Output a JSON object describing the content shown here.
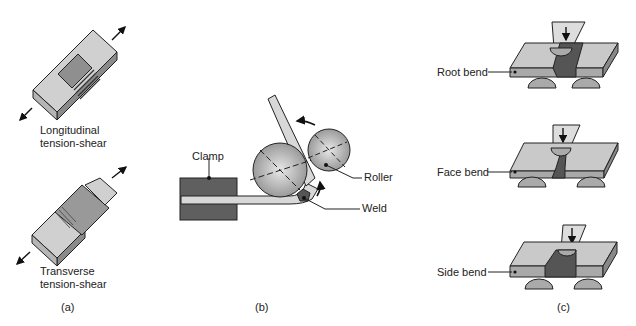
{
  "panels": {
    "a": {
      "caption": "(a)",
      "specimens": [
        {
          "label_line1": "Longitudinal",
          "label_line2": "tension-shear"
        },
        {
          "label_line1": "Transverse",
          "label_line2": "tension-shear"
        }
      ]
    },
    "b": {
      "caption": "(b)",
      "labels": {
        "clamp": "Clamp",
        "roller": "Roller",
        "weld": "Weld"
      }
    },
    "c": {
      "caption": "(c)",
      "tests": [
        {
          "label": "Root bend"
        },
        {
          "label": "Face bend"
        },
        {
          "label": "Side bend"
        }
      ]
    }
  },
  "colors": {
    "plate_light": "#c9c9c9",
    "plate_mid": "#a9a9a9",
    "weld_dark": "#555555",
    "clamp": "#5f5f5f",
    "outline": "#222222"
  }
}
